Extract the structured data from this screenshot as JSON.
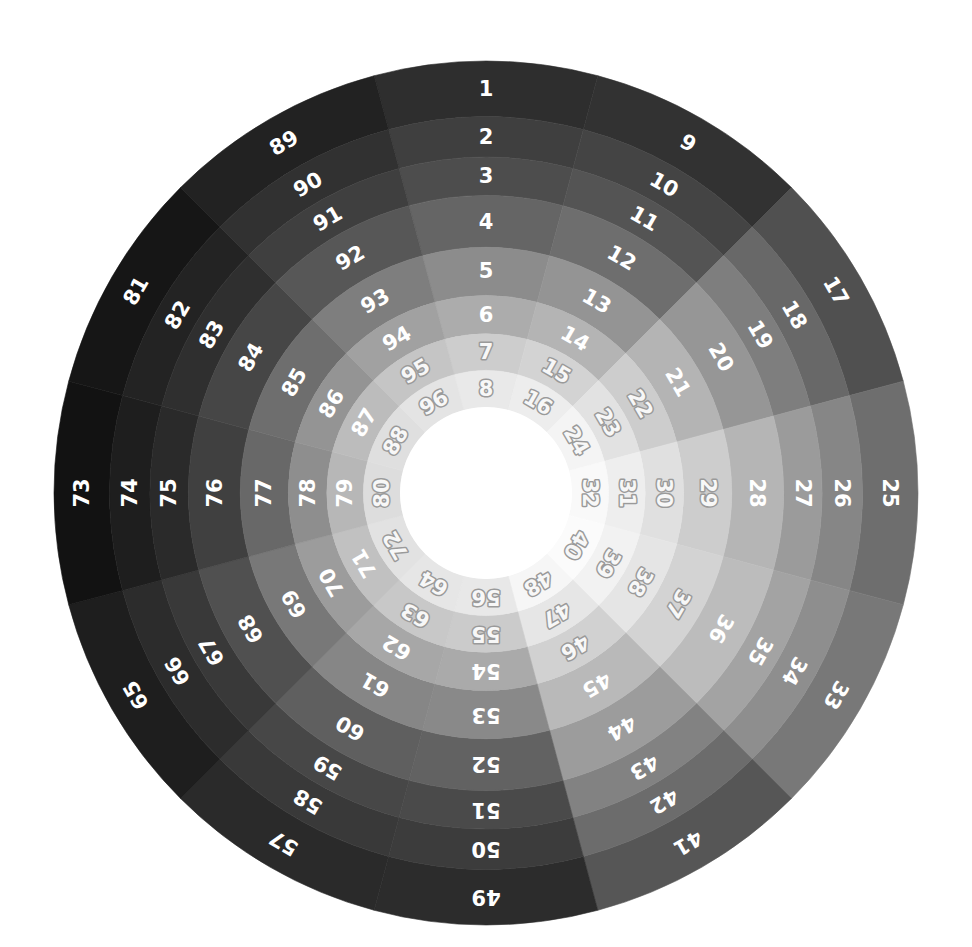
{
  "figure": {
    "width": 972,
    "height": 947,
    "background": "#ffffff"
  },
  "geometry": {
    "center_x": 486,
    "center_y": 493,
    "outer_radius": 432,
    "inner_radius": 86,
    "sectors": 12,
    "rings": 8,
    "sector_span_degrees": 30,
    "first_sector_center_degrees": 0,
    "numbering": "outer ring to inner ring within each sector, sectors clockwise starting at top"
  },
  "chart_data": {
    "type": "heatmap",
    "xlabel": "",
    "ylabel": "",
    "categories": [
      "S1",
      "S2",
      "S3",
      "S4",
      "S5",
      "S6",
      "S7",
      "S8",
      "S9",
      "S10",
      "S11",
      "S12"
    ],
    "ring_labels": [
      "R1 (outer)",
      "R2",
      "R3",
      "R4",
      "R5",
      "R6",
      "R7",
      "R8 (inner)"
    ],
    "legend": "none",
    "grid": false,
    "sectors": [
      {
        "index": 1,
        "center_deg": 0,
        "labels": [
          "1",
          "2",
          "3",
          "4",
          "5",
          "6",
          "7",
          "8"
        ],
        "values": [
          46,
          63,
          77,
          101,
          140,
          172,
          205,
          233
        ],
        "colors": [
          "#2e2e2e",
          "#3f3f3f",
          "#4d4d4d",
          "#656565",
          "#8c8c8c",
          "#acacac",
          "#cdcdcd",
          "#e9e9e9"
        ]
      },
      {
        "index": 2,
        "center_deg": 30,
        "labels": [
          "9",
          "10",
          "11",
          "12",
          "13",
          "14",
          "15",
          "16"
        ],
        "values": [
          50,
          68,
          84,
          110,
          148,
          180,
          211,
          237
        ],
        "colors": [
          "#323232",
          "#444444",
          "#545454",
          "#6e6e6e",
          "#949494",
          "#b4b4b4",
          "#d3d3d3",
          "#ededed"
        ]
      },
      {
        "index": 3,
        "center_deg": 60,
        "labels": [
          "17",
          "18",
          "19",
          "20",
          "21",
          "22",
          "23",
          "24"
        ],
        "values": [
          80,
          104,
          126,
          150,
          180,
          205,
          226,
          244
        ],
        "colors": [
          "#505050",
          "#686868",
          "#7e7e7e",
          "#969696",
          "#b4b4b4",
          "#cdcdcd",
          "#e2e2e2",
          "#f4f4f4"
        ]
      },
      {
        "index": 4,
        "center_deg": 90,
        "labels": [
          "25",
          "26",
          "27",
          "28",
          "29",
          "30",
          "31",
          "32"
        ],
        "values": [
          110,
          134,
          155,
          181,
          205,
          224,
          238,
          249
        ],
        "colors": [
          "#6e6e6e",
          "#868686",
          "#9b9b9b",
          "#b5b5b5",
          "#cdcdcd",
          "#e0e0e0",
          "#eeeeee",
          "#f9f9f9"
        ]
      },
      {
        "index": 5,
        "center_deg": 120,
        "labels": [
          "33",
          "34",
          "35",
          "36",
          "37",
          "38",
          "39",
          "40"
        ],
        "values": [
          120,
          142,
          163,
          188,
          211,
          229,
          242,
          251
        ],
        "colors": [
          "#787878",
          "#8e8e8e",
          "#a3a3a3",
          "#bcbcbc",
          "#d3d3d3",
          "#e5e5e5",
          "#f2f2f2",
          "#fbfbfb"
        ]
      },
      {
        "index": 6,
        "center_deg": 150,
        "labels": [
          "41",
          "42",
          "43",
          "44",
          "45",
          "46",
          "47",
          "48"
        ],
        "values": [
          86,
          108,
          130,
          156,
          185,
          209,
          230,
          246
        ],
        "colors": [
          "#565656",
          "#6c6c6c",
          "#828282",
          "#9c9c9c",
          "#b9b9b9",
          "#d1d1d1",
          "#e6e6e6",
          "#f6f6f6"
        ]
      },
      {
        "index": 7,
        "center_deg": 180,
        "labels": [
          "49",
          "50",
          "51",
          "52",
          "53",
          "54",
          "55",
          "56"
        ],
        "values": [
          44,
          60,
          74,
          98,
          137,
          170,
          203,
          232
        ],
        "colors": [
          "#2c2c2c",
          "#3c3c3c",
          "#4a4a4a",
          "#626262",
          "#898989",
          "#aaaaaa",
          "#cbcbcb",
          "#e8e8e8"
        ]
      },
      {
        "index": 8,
        "center_deg": 210,
        "labels": [
          "57",
          "58",
          "59",
          "60",
          "61",
          "62",
          "63",
          "64"
        ],
        "values": [
          42,
          57,
          71,
          95,
          134,
          167,
          200,
          230
        ],
        "colors": [
          "#2a2a2a",
          "#393939",
          "#474747",
          "#5f5f5f",
          "#868686",
          "#a7a7a7",
          "#c8c8c8",
          "#e6e6e6"
        ]
      },
      {
        "index": 9,
        "center_deg": 240,
        "labels": [
          "65",
          "66",
          "67",
          "68",
          "69",
          "70",
          "71",
          "72"
        ],
        "values": [
          30,
          44,
          57,
          80,
          120,
          156,
          193,
          226
        ],
        "colors": [
          "#1e1e1e",
          "#2c2c2c",
          "#393939",
          "#505050",
          "#787878",
          "#9c9c9c",
          "#c1c1c1",
          "#e2e2e2"
        ]
      },
      {
        "index": 10,
        "center_deg": 270,
        "labels": [
          "73",
          "74",
          "75",
          "76",
          "77",
          "78",
          "79",
          "80"
        ],
        "values": [
          18,
          30,
          42,
          64,
          104,
          142,
          183,
          221
        ],
        "colors": [
          "#121212",
          "#1e1e1e",
          "#2a2a2a",
          "#404040",
          "#686868",
          "#8e8e8e",
          "#b7b7b7",
          "#dddddd"
        ]
      },
      {
        "index": 11,
        "center_deg": 300,
        "labels": [
          "81",
          "82",
          "83",
          "84",
          "85",
          "86",
          "87",
          "88"
        ],
        "values": [
          22,
          35,
          47,
          70,
          110,
          148,
          188,
          223
        ],
        "colors": [
          "#161616",
          "#232323",
          "#2f2f2f",
          "#464646",
          "#6e6e6e",
          "#949494",
          "#bcbcbc",
          "#dfdfdf"
        ]
      },
      {
        "index": 12,
        "center_deg": 330,
        "labels": [
          "89",
          "90",
          "91",
          "92",
          "93",
          "94",
          "95",
          "96"
        ],
        "values": [
          34,
          49,
          63,
          87,
          126,
          161,
          197,
          228
        ],
        "colors": [
          "#222222",
          "#313131",
          "#3f3f3f",
          "#575757",
          "#7e7e7e",
          "#a1a1a1",
          "#c5c5c5",
          "#e4e4e4"
        ]
      }
    ]
  },
  "label_style": {
    "dark_text_color": "#ffffff",
    "light_text_color": "#f7f7f7",
    "light_text_stroke": "#9a9a9a",
    "dark_text_stroke": "none",
    "light_threshold": 196
  }
}
